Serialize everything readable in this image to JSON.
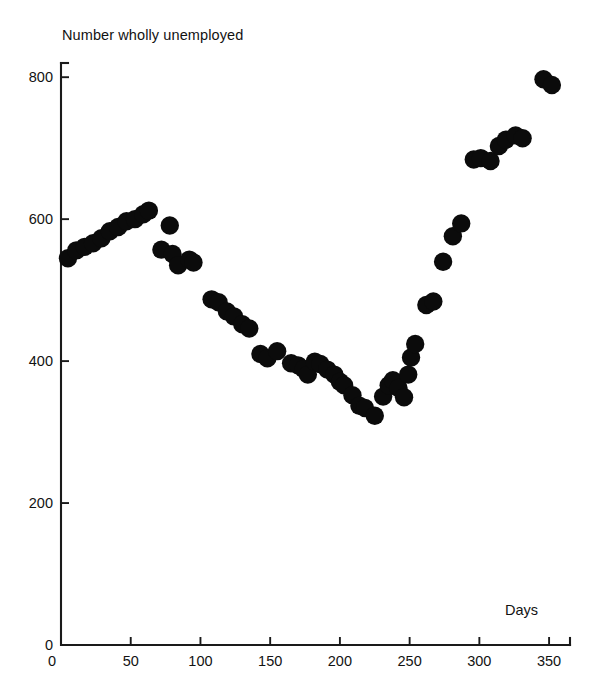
{
  "chart_data": {
    "type": "scatter",
    "title": "Number wholly unemployed",
    "xlabel": "Days",
    "ylabel": "",
    "xlim": [
      0,
      365
    ],
    "ylim": [
      0,
      820
    ],
    "xticks": [
      0,
      50,
      100,
      150,
      200,
      250,
      300,
      350
    ],
    "yticks": [
      0,
      200,
      400,
      600,
      800
    ],
    "grid": false,
    "legend": null,
    "marker": "filled-circle",
    "marker_color": "#0b0b0b",
    "points": [
      {
        "x": 5,
        "y": 545
      },
      {
        "x": 11,
        "y": 556
      },
      {
        "x": 17,
        "y": 561
      },
      {
        "x": 23,
        "y": 566
      },
      {
        "x": 29,
        "y": 573
      },
      {
        "x": 35,
        "y": 583
      },
      {
        "x": 41,
        "y": 589
      },
      {
        "x": 47,
        "y": 597
      },
      {
        "x": 53,
        "y": 600
      },
      {
        "x": 59,
        "y": 607
      },
      {
        "x": 63,
        "y": 612
      },
      {
        "x": 72,
        "y": 557
      },
      {
        "x": 78,
        "y": 591
      },
      {
        "x": 80,
        "y": 551
      },
      {
        "x": 84,
        "y": 535
      },
      {
        "x": 92,
        "y": 543
      },
      {
        "x": 95,
        "y": 539
      },
      {
        "x": 108,
        "y": 487
      },
      {
        "x": 113,
        "y": 483
      },
      {
        "x": 119,
        "y": 470
      },
      {
        "x": 124,
        "y": 463
      },
      {
        "x": 130,
        "y": 452
      },
      {
        "x": 135,
        "y": 446
      },
      {
        "x": 143,
        "y": 410
      },
      {
        "x": 148,
        "y": 404
      },
      {
        "x": 155,
        "y": 414
      },
      {
        "x": 165,
        "y": 397
      },
      {
        "x": 170,
        "y": 394
      },
      {
        "x": 174,
        "y": 389
      },
      {
        "x": 177,
        "y": 381
      },
      {
        "x": 182,
        "y": 399
      },
      {
        "x": 186,
        "y": 396
      },
      {
        "x": 191,
        "y": 388
      },
      {
        "x": 196,
        "y": 381
      },
      {
        "x": 200,
        "y": 371
      },
      {
        "x": 203,
        "y": 366
      },
      {
        "x": 209,
        "y": 352
      },
      {
        "x": 214,
        "y": 337
      },
      {
        "x": 218,
        "y": 334
      },
      {
        "x": 225,
        "y": 323
      },
      {
        "x": 231,
        "y": 350
      },
      {
        "x": 235,
        "y": 366
      },
      {
        "x": 238,
        "y": 373
      },
      {
        "x": 242,
        "y": 362
      },
      {
        "x": 246,
        "y": 349
      },
      {
        "x": 249,
        "y": 381
      },
      {
        "x": 251,
        "y": 405
      },
      {
        "x": 254,
        "y": 424
      },
      {
        "x": 262,
        "y": 479
      },
      {
        "x": 267,
        "y": 484
      },
      {
        "x": 274,
        "y": 540
      },
      {
        "x": 281,
        "y": 576
      },
      {
        "x": 287,
        "y": 594
      },
      {
        "x": 296,
        "y": 684
      },
      {
        "x": 301,
        "y": 686
      },
      {
        "x": 308,
        "y": 682
      },
      {
        "x": 314,
        "y": 703
      },
      {
        "x": 319,
        "y": 712
      },
      {
        "x": 326,
        "y": 718
      },
      {
        "x": 331,
        "y": 714
      },
      {
        "x": 346,
        "y": 797
      },
      {
        "x": 352,
        "y": 789
      }
    ]
  },
  "axes": {
    "x_tick_labels": [
      "0",
      "50",
      "100",
      "150",
      "200",
      "250",
      "300",
      "350"
    ],
    "y_tick_labels": [
      "0",
      "200",
      "400",
      "600",
      "800"
    ]
  }
}
